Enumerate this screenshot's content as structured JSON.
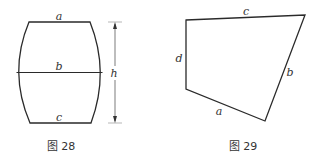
{
  "figures": [
    {
      "id": "fig28",
      "caption": "图 28",
      "shape": "barrel-shaped region with straight top and bottom edges and convex curved sides",
      "labels": {
        "top": "a",
        "middle": "b",
        "bottom": "c",
        "height": "h"
      }
    },
    {
      "id": "fig29",
      "caption": "图 29",
      "shape": "irregular quadrilateral",
      "labels": {
        "top": "c",
        "left": "d",
        "right": "b",
        "bottom": "a"
      }
    }
  ],
  "colors": {
    "stroke": "#2a2a2a",
    "text": "#333333",
    "background": "#ffffff"
  }
}
